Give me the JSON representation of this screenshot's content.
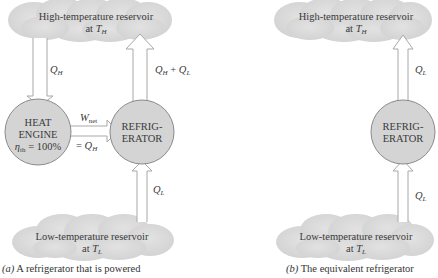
{
  "panel_a": {
    "high_reservoir": {
      "line1": "High-temperature reservoir",
      "line2_prefix": "at ",
      "line2_var": "T",
      "line2_sub": "H"
    },
    "low_reservoir": {
      "line1": "Low-temperature reservoir",
      "line2_prefix": "at ",
      "line2_var": "T",
      "line2_sub": "L"
    },
    "heat_engine": {
      "line1": "HEAT",
      "line2": "ENGINE",
      "eff_var": "η",
      "eff_sub": "th",
      "eff_value": " = 100%"
    },
    "refrigerator": {
      "line1": "REFRIG-",
      "line2": "ERATOR"
    },
    "arrow_qh": {
      "var": "Q",
      "sub": "H"
    },
    "arrow_qh_plus_ql": {
      "var1": "Q",
      "sub1": "H",
      "op": " + ",
      "var2": "Q",
      "sub2": "L"
    },
    "arrow_wnet": {
      "var": "W",
      "sub": "net",
      "eq_prefix": "= ",
      "eq_var": "Q",
      "eq_sub": "H"
    },
    "arrow_ql": {
      "var": "Q",
      "sub": "L"
    },
    "caption": {
      "label": "(a)",
      "text": " A refrigerator that is powered"
    }
  },
  "panel_b": {
    "high_reservoir": {
      "line1": "High-temperature reservoir",
      "line2_prefix": "at ",
      "line2_var": "T",
      "line2_sub": "H"
    },
    "low_reservoir": {
      "line1": "Low-temperature reservoir",
      "line2_prefix": "at ",
      "line2_var": "T",
      "line2_sub": "L"
    },
    "refrigerator": {
      "line1": "REFRIG-",
      "line2": "ERATOR"
    },
    "arrow_ql_top": {
      "var": "Q",
      "sub": "L"
    },
    "arrow_ql_bottom": {
      "var": "Q",
      "sub": "L"
    },
    "caption": {
      "label": "(b)",
      "text": " The equivalent refrigerator"
    }
  },
  "colors": {
    "cloud": "#d9d9d9",
    "node_fill": "#d4d4d4",
    "node_stroke": "#8a8a8a",
    "arrow_stroke": "#a8a8a8"
  }
}
